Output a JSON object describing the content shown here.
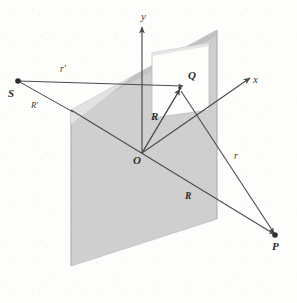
{
  "figure": {
    "kind": "geometric-diagram",
    "background_color": "#fdfdfc",
    "plane_fill": "#cfcfcf",
    "aperture_fill": "#fdfdfc",
    "line_color": "#4a4a4a",
    "label_color": "#3a3a3a"
  },
  "axes": [
    {
      "name": "y-axis",
      "label": "y",
      "label_x": 141,
      "label_y": 11
    },
    {
      "name": "x-axis",
      "label": "x",
      "label_x": 253,
      "label_y": 74
    }
  ],
  "points": [
    {
      "name": "origin",
      "label": "O",
      "label_x": 133,
      "label_y": 155,
      "x": 142,
      "y": 153,
      "dot": false
    },
    {
      "name": "source-point",
      "label": "S",
      "label_x": 8,
      "label_y": 88,
      "x": 18,
      "y": 81,
      "dot": true
    },
    {
      "name": "aperture-point",
      "label": "Q",
      "label_x": 188,
      "label_y": 70,
      "x": 180,
      "y": 88,
      "dot": false
    },
    {
      "name": "observation-point",
      "label": "P",
      "label_x": 272,
      "label_y": 241,
      "x": 275,
      "y": 235,
      "dot": true
    }
  ],
  "vectors": [
    {
      "name": "r-prime-vector",
      "label": "r'",
      "label_x": 60,
      "label_y": 65,
      "from": "S",
      "to": "aperture-plane-trace"
    },
    {
      "name": "R-prime-vector",
      "label": "R'",
      "label_x": 31,
      "label_y": 101,
      "from": "S",
      "to": "plane-corner"
    },
    {
      "name": "R-vector",
      "label": "R",
      "label_x": 151,
      "label_y": 111,
      "from": "O",
      "to": "Q"
    },
    {
      "name": "r-vector",
      "label": "r",
      "label_x": 234,
      "label_y": 152,
      "from": "Q",
      "to": "P"
    },
    {
      "name": "R-lower-vector",
      "label": "R",
      "label_x": 185,
      "label_y": 192,
      "from": "O",
      "to": "P"
    }
  ]
}
